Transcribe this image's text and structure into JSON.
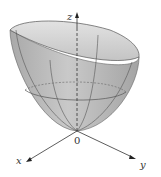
{
  "figure": {
    "axes": {
      "z_label": "z",
      "x_label": "x",
      "y_label": "y",
      "origin_label": "0"
    },
    "colors": {
      "surface_fill": "#b8b8b8",
      "surface_inner": "#d6d6d6",
      "grid_line": "#555555",
      "axis": "#333333",
      "background": "#ffffff"
    }
  }
}
